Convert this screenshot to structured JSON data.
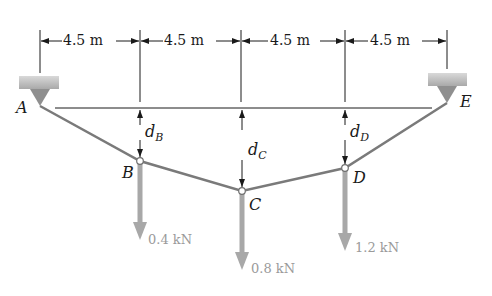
{
  "dimensions": [
    {
      "label": "4.5 m"
    },
    {
      "label": "4.5 m"
    },
    {
      "label": "4.5 m"
    },
    {
      "label": "4.5 m"
    }
  ],
  "points": {
    "A": "A",
    "B": "B",
    "C": "C",
    "D": "D",
    "E": "E"
  },
  "sags": {
    "dB": {
      "var": "d",
      "sub": "B"
    },
    "dC": {
      "var": "d",
      "sub": "C"
    },
    "dD": {
      "var": "d",
      "sub": "D"
    }
  },
  "loads": {
    "B": "0.4 kN",
    "C": "0.8 kN",
    "D": "1.2 kN"
  },
  "colors": {
    "line": "#1a1a1a",
    "cable": "#7a7a7a",
    "load_arrow": "#a8a8a8",
    "support": "#b5b5b5",
    "load_text": "#9a9a9a"
  }
}
